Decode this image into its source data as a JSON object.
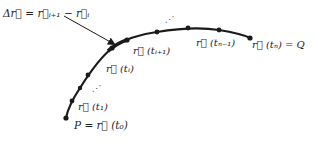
{
  "diagram": {
    "curve": {
      "stroke": "#1a1a1a",
      "points": [
        {
          "name": "P",
          "x": 66,
          "y": 118
        },
        {
          "name": "t1",
          "x": 72,
          "y": 101
        },
        {
          "name": "t_a",
          "x": 80,
          "y": 88
        },
        {
          "name": "t_b",
          "x": 88,
          "y": 75
        },
        {
          "name": "ti",
          "x": 112,
          "y": 48
        },
        {
          "name": "ti+1",
          "x": 127,
          "y": 40
        },
        {
          "name": "t_c",
          "x": 157,
          "y": 32
        },
        {
          "name": "t_d",
          "x": 188,
          "y": 28
        },
        {
          "name": "tn-1",
          "x": 219,
          "y": 30
        },
        {
          "name": "Q",
          "x": 250,
          "y": 38
        }
      ]
    },
    "labels": {
      "delta_r": "Δr⃗ = r⃗ᵢ₊₁ − r⃗ᵢ",
      "r_ti": "r⃗ (tᵢ)",
      "r_ti1": "r⃗ (tᵢ₊₁)",
      "r_tn1": "r⃗ (tₙ₋₁)",
      "r_tn_Q": "r⃗ (tₙ) = Q",
      "r_t1": "r⃗ (t₁)",
      "P_r_t0": "P = r⃗ (t₀)",
      "ellipsis_upper": "⋰",
      "ellipsis_lower": "⋰"
    },
    "arrow": {
      "from": [
        64,
        16
      ],
      "to": [
        116,
        45
      ],
      "color": "#1a1a1a"
    }
  }
}
